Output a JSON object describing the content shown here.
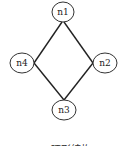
{
  "diagram": {
    "type": "ring-topology",
    "nodes": [
      {
        "id": "n1",
        "label": "n1",
        "cx": 63,
        "cy": 12
      },
      {
        "id": "n2",
        "label": "n2",
        "cx": 105,
        "cy": 63
      },
      {
        "id": "n3",
        "label": "n3",
        "cx": 64,
        "cy": 110
      },
      {
        "id": "n4",
        "label": "n4",
        "cx": 22,
        "cy": 63
      }
    ],
    "edges": [
      [
        "n1",
        "n2"
      ],
      [
        "n2",
        "n3"
      ],
      [
        "n3",
        "n4"
      ],
      [
        "n4",
        "n1"
      ]
    ],
    "caption": "(c) 环形结构"
  },
  "colors": {
    "stroke": "#222222",
    "background": "#ffffff"
  }
}
